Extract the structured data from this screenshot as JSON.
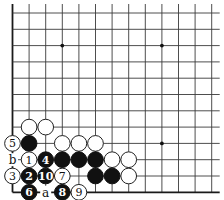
{
  "diagram": {
    "type": "go-board-diagram",
    "grid": {
      "columns": 13,
      "rows": 12,
      "origin_x": 12.5,
      "origin_y": 13,
      "spacing_x": 16.6,
      "spacing_y": 16.3,
      "top_extend": 9,
      "right_extend": 8,
      "left_edge": true,
      "bottom_edge": true
    },
    "colors": {
      "board": "#ffffff",
      "line": "#3a3a3a",
      "black_stone": "#111111",
      "white_stone": "#ffffff"
    },
    "star_points": [
      {
        "col": 3,
        "row": 2
      },
      {
        "col": 9,
        "row": 2
      },
      {
        "col": 9,
        "row": 8
      }
    ],
    "stones": [
      {
        "col": 1,
        "row": 7,
        "color": "white",
        "label": ""
      },
      {
        "col": 2,
        "row": 7,
        "color": "white",
        "label": ""
      },
      {
        "col": 0,
        "row": 8,
        "color": "white",
        "label": "5"
      },
      {
        "col": 1,
        "row": 8,
        "color": "black",
        "label": ""
      },
      {
        "col": 3,
        "row": 8,
        "color": "white",
        "label": ""
      },
      {
        "col": 4,
        "row": 8,
        "color": "white",
        "label": ""
      },
      {
        "col": 5,
        "row": 8,
        "color": "white",
        "label": ""
      },
      {
        "col": 1,
        "row": 9,
        "color": "white",
        "label": "1"
      },
      {
        "col": 2,
        "row": 9,
        "color": "black",
        "label": "4"
      },
      {
        "col": 3,
        "row": 9,
        "color": "black",
        "label": ""
      },
      {
        "col": 4,
        "row": 9,
        "color": "black",
        "label": ""
      },
      {
        "col": 5,
        "row": 9,
        "color": "black",
        "label": ""
      },
      {
        "col": 6,
        "row": 9,
        "color": "white",
        "label": ""
      },
      {
        "col": 7,
        "row": 9,
        "color": "white",
        "label": ""
      },
      {
        "col": 0,
        "row": 10,
        "color": "white",
        "label": "3"
      },
      {
        "col": 1,
        "row": 10,
        "color": "black",
        "label": "2"
      },
      {
        "col": 2,
        "row": 10,
        "color": "black",
        "label": "10"
      },
      {
        "col": 3,
        "row": 10,
        "color": "white",
        "label": "7"
      },
      {
        "col": 5,
        "row": 10,
        "color": "black",
        "label": ""
      },
      {
        "col": 6,
        "row": 10,
        "color": "black",
        "label": ""
      },
      {
        "col": 7,
        "row": 10,
        "color": "white",
        "label": ""
      },
      {
        "col": 1,
        "row": 11,
        "color": "black",
        "label": "6"
      },
      {
        "col": 3,
        "row": 11,
        "color": "black",
        "label": "8"
      },
      {
        "col": 4,
        "row": 11,
        "color": "white",
        "label": "9"
      }
    ],
    "markers": [
      {
        "col": 0,
        "row": 9,
        "text": "b"
      },
      {
        "col": 2,
        "row": 11,
        "text": "a"
      }
    ]
  }
}
